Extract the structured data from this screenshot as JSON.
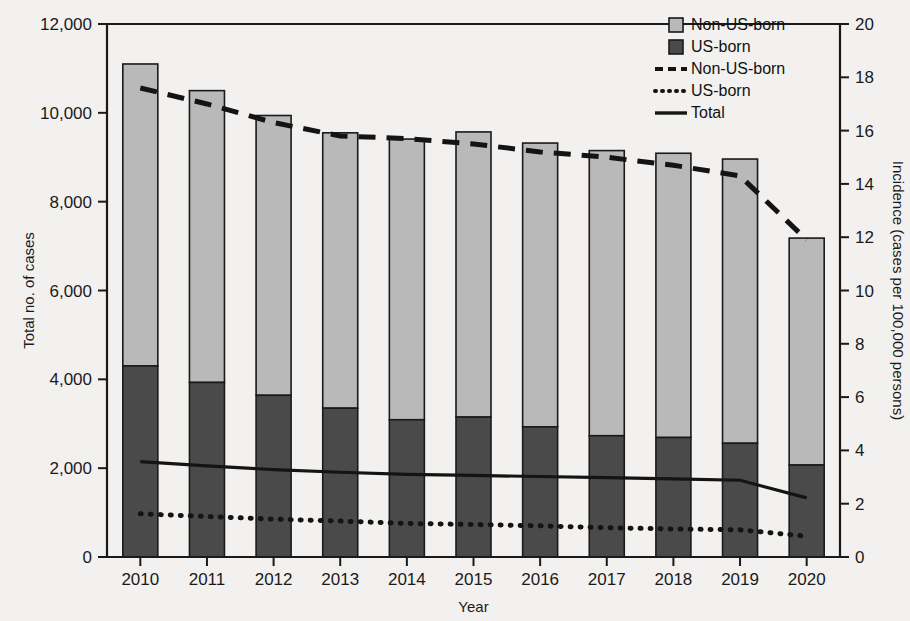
{
  "chart_data": {
    "type": "bar",
    "title": "",
    "subtitle": "",
    "xlabel": "Year",
    "ylabel": "Total no. of cases",
    "y2label": "Incidence (cases per 100,000 persons)",
    "grid": false,
    "legend_position": "top-right",
    "categories": [
      "2010",
      "2011",
      "2012",
      "2013",
      "2014",
      "2015",
      "2016",
      "2017",
      "2018",
      "2019",
      "2020"
    ],
    "ylim": [
      0,
      12000
    ],
    "yticks": [
      0,
      2000,
      4000,
      6000,
      8000,
      10000,
      12000
    ],
    "ytick_labels": [
      "0",
      "2,000",
      "4,000",
      "6,000",
      "8,000",
      "10,000",
      "12,000"
    ],
    "y2lim": [
      0,
      20
    ],
    "y2ticks": [
      0,
      2,
      4,
      6,
      8,
      10,
      12,
      14,
      16,
      18,
      20
    ],
    "y2tick_labels": [
      "0",
      "2",
      "4",
      "6",
      "8",
      "10",
      "12",
      "14",
      "16",
      "18",
      "20"
    ],
    "series": [
      {
        "name": "US-born",
        "kind": "bar",
        "stack": "cases",
        "axis": "left",
        "color": "#4a4a4a",
        "values": [
          4300,
          3930,
          3640,
          3350,
          3090,
          3150,
          2930,
          2730,
          2690,
          2560,
          2070
        ]
      },
      {
        "name": "Non-US-born",
        "kind": "bar",
        "stack": "cases",
        "axis": "left",
        "color": "#b9b9b9",
        "values": [
          6800,
          6570,
          6300,
          6200,
          6320,
          6420,
          6390,
          6420,
          6400,
          6400,
          5110
        ]
      },
      {
        "name": "Non-US-born",
        "kind": "line",
        "style": "dashed",
        "axis": "right",
        "color": "#141414",
        "values": [
          17.6,
          17.0,
          16.3,
          15.8,
          15.7,
          15.5,
          15.2,
          15.0,
          14.7,
          14.3,
          11.9
        ]
      },
      {
        "name": "US-born",
        "kind": "line",
        "style": "dotted",
        "axis": "right",
        "color": "#141414",
        "values": [
          1.62,
          1.52,
          1.42,
          1.35,
          1.26,
          1.22,
          1.17,
          1.1,
          1.05,
          1.02,
          0.78
        ]
      },
      {
        "name": "Total",
        "kind": "line",
        "style": "solid",
        "axis": "right",
        "color": "#141414",
        "values": [
          3.58,
          3.42,
          3.28,
          3.18,
          3.1,
          3.06,
          3.02,
          2.98,
          2.93,
          2.88,
          2.22
        ]
      }
    ],
    "bar_totals": [
      11100,
      10500,
      9940,
      9550,
      9410,
      9570,
      9320,
      9150,
      9090,
      8960,
      7180
    ]
  },
  "legend": {
    "items": [
      {
        "label": "Non-US-born",
        "marker": "swatch-light",
        "color": "#b9b9b9"
      },
      {
        "label": "US-born",
        "marker": "swatch-dark",
        "color": "#4a4a4a"
      },
      {
        "label": "Non-US-born",
        "marker": "line-dashed",
        "color": "#141414"
      },
      {
        "label": "US-born",
        "marker": "line-dotted",
        "color": "#141414"
      },
      {
        "label": "Total",
        "marker": "line-solid",
        "color": "#141414"
      }
    ]
  },
  "axes": {
    "left_title": "Total no. of cases",
    "right_title": "Incidence (cases per 100,000 persons)",
    "bottom_title": "Year"
  },
  "colors": {
    "bar_light": "#b9b9b9",
    "bar_dark": "#4a4a4a",
    "line": "#141414",
    "axis": "#1a1a1a",
    "background": "#f2f1ef"
  }
}
